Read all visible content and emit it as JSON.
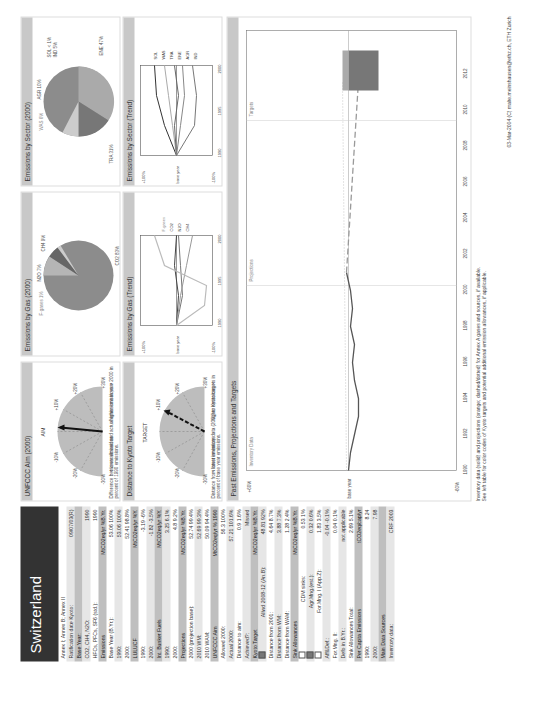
{
  "country": "Switzerland",
  "sidebar": {
    "rows": [
      {
        "type": "text",
        "label": "Annex I; Annex B; Annex II",
        "value": ""
      },
      {
        "type": "text",
        "label": "Ratification date Kyoto:",
        "value": "09/07/03(R)"
      },
      {
        "type": "section",
        "label": "Base Year:",
        "value": ""
      },
      {
        "type": "text",
        "label": "CO2, CH4, N2O:",
        "value": "1990"
      },
      {
        "type": "text",
        "label": "HFCs, PFCs, SF6 (std.):",
        "value": "1990"
      },
      {
        "type": "section",
        "label": "Emissions",
        "value": "MtCO2eq/yr   %B.Yr."
      },
      {
        "type": "text",
        "label": "Base Year (B.Yr.):",
        "value": "53.06   100%"
      },
      {
        "type": "text",
        "label": "1990:",
        "value": "53.06   100%"
      },
      {
        "type": "text",
        "label": "2000:",
        "value": "52.41   98.8%"
      },
      {
        "type": "section",
        "label": "LULUCF",
        "value": "MtCO2eq/yr   %Y."
      },
      {
        "type": "text",
        "label": "1990:",
        "value": "-3.19   -6%"
      },
      {
        "type": "text",
        "label": "2000:",
        "value": "-1.82   -3.5%"
      },
      {
        "type": "section",
        "label": "Int. Bunker Fuels",
        "value": "MtCO2eq/yr   %Y."
      },
      {
        "type": "text",
        "label": "1990:",
        "value": "3.25   6.1%"
      },
      {
        "type": "text",
        "label": "2000:",
        "value": "4.8   9.2%"
      },
      {
        "type": "section",
        "label": "Projections",
        "value": "MtCO2eq/yr   %B.Yr."
      },
      {
        "type": "text",
        "label": "2000 (projection base):",
        "value": "52.74   99.4%"
      },
      {
        "type": "text",
        "label": "2010 WM:",
        "value": "52.69   99.3%"
      },
      {
        "type": "text",
        "label": "2010 WAM:",
        "value": "50.09   94.4%"
      },
      {
        "type": "section",
        "label": "UNFCCC Aim",
        "value": "MtCO2eq/yr   % 1990"
      },
      {
        "type": "text",
        "label": "Allowed 2000:",
        "value": "56.3   100%"
      },
      {
        "type": "text",
        "label": "Actual 2000:",
        "value": "57.21   101.6%"
      },
      {
        "type": "text",
        "label": "Distance to aim:",
        "value": "0.9   1.6%"
      },
      {
        "type": "text",
        "label": "Achieved?:",
        "value": "Missed"
      },
      {
        "type": "section",
        "label": "Kyoto Target",
        "value": "MtCO2eq/yr   %B.Yr."
      },
      {
        "type": "check",
        "label": "Allwd 2008-12 (An.B):",
        "value": "48.81   92%",
        "checked": true
      },
      {
        "type": "text",
        "label": "Distance from 2001:",
        "value": "4.64   8.7%"
      },
      {
        "type": "text",
        "label": "Distance from WM:",
        "value": "3.88   7.3%"
      },
      {
        "type": "text",
        "label": "Distance from WAM:",
        "value": "1.28   2.4%"
      },
      {
        "type": "section",
        "label": "Sink Allowances",
        "value": "MtCO2eq/yr   %B.Yr."
      },
      {
        "type": "check",
        "label": "CDM sinks:",
        "value": "0.53   1%",
        "checked": false
      },
      {
        "type": "check",
        "label": "Agr.Mng.(est.):",
        "value": "0.32   0.6%",
        "checked": true
      },
      {
        "type": "check",
        "label": "For.Mng. I (App.Z):",
        "value": "1.83   3.5%",
        "checked": false
      },
      {
        "type": "text",
        "label": "Aff&Def.:",
        "value": "-0.04   -0.1%"
      },
      {
        "type": "text",
        "label": "For.Mng. II:",
        "value": "0.04   0.1%"
      },
      {
        "type": "text",
        "label": "Defo in B.Yr.:",
        "value": "not applicable"
      },
      {
        "type": "text",
        "label": "Sink Allowances Total:",
        "value": "2.69   5.1%"
      },
      {
        "type": "section",
        "label": "Per Capita Emissions",
        "value": "tCO2eq/cap/yr"
      },
      {
        "type": "text",
        "label": "1990:",
        "value": "8.24"
      },
      {
        "type": "text",
        "label": "2000:",
        "value": "7.98"
      },
      {
        "type": "section",
        "label": "Main Data Sources",
        "value": ""
      },
      {
        "type": "text",
        "label": "Inventory data:",
        "value": "CRF 2003"
      }
    ]
  },
  "panels": {
    "unfccc": {
      "title": "UNFCCC Aim (2000)",
      "dial_label": "AIM",
      "ticks": [
        "-30%",
        "-20%",
        "-10%",
        "+10%",
        "+20%",
        "+30%"
      ],
      "lower": "< lower emissions",
      "higher": "higher emissions >",
      "caption": "Difference between allowed and actual emissions in year 2000 in percent of 1990 emissions."
    },
    "kyoto": {
      "title": "Distance to Kyoto Target",
      "dial_label": "TARGET",
      "ticks": [
        "-30%",
        "-20%",
        "-10%",
        "+10%",
        "+20%",
        "+30%"
      ],
      "lower": "< lower emissions",
      "higher": "higher emissions >",
      "caption": "Distance from latest inventory data (2001) to Kyoto targets in percent of base year emissions."
    },
    "gas_pie": {
      "title": "Emissions by Gas (2000)",
      "labels": [
        "F-gases 1%",
        "N2O 7%",
        "CH4 9%",
        "CO2 83%"
      ]
    },
    "sector_pie": {
      "title": "Emissions by Sector (2000)",
      "labels": [
        "WAS 6%",
        "AGR 10%",
        "SOL < 1%",
        "IND 5%",
        "TRA 31%",
        "ENE 47%"
      ]
    },
    "gas_trend": {
      "title": "Emissions by Gas (Trend)",
      "yticks": [
        "+100%",
        "+50%",
        "+20%",
        "+10%",
        "base year",
        "-10%",
        "-20%",
        "-50%",
        "-100%"
      ],
      "xticks": [
        "1990",
        "1995",
        "2000"
      ],
      "legend": [
        "F-gases",
        "CO2",
        "N2O",
        "CH4"
      ]
    },
    "sector_trend": {
      "title": "Emissions by Sector (Trend)",
      "yticks": [
        "+100%",
        "+50%",
        "+20%",
        "+10%",
        "base year",
        "-10%",
        "-20%",
        "-50%",
        "-100%"
      ],
      "xticks": [
        "1990",
        "1995",
        "2000"
      ],
      "legend": [
        "SOL",
        "WAS",
        "TRA",
        "ENE",
        "AGR",
        "IND"
      ]
    },
    "past": {
      "title": "Past Emissions, Projections and Targets",
      "section_labels": [
        "Inventory Data",
        "Projections",
        "Targets"
      ],
      "yticks": [
        "+60%",
        "+50%",
        "+40%",
        "+30%",
        "+20%",
        "+10%",
        "base year",
        "-10%",
        "-20%",
        "-30%",
        "-40%",
        "-60%"
      ],
      "xticks": [
        "1990",
        "1992",
        "1994",
        "1996",
        "1998",
        "2000",
        "2002",
        "2004",
        "2006",
        "2008",
        "2010",
        "2012"
      ]
    }
  },
  "footer": {
    "line1": "Inventory data (solid) and projections (orange; dashed/dotted) for Annex A gases and sources, if available.",
    "line2": "See left table for color codes of Kyoto targets and potential additional emission allowances, if applicable.",
    "credit": "03-Mar-2004 (C) malte.meinshausen@ethz.ch, ETH Zurich"
  },
  "chart_data": [
    {
      "type": "pie",
      "title": "Emissions by Gas (2000)",
      "categories": [
        "CO2",
        "CH4",
        "N2O",
        "F-gases"
      ],
      "values": [
        83,
        9,
        7,
        1
      ]
    },
    {
      "type": "pie",
      "title": "Emissions by Sector (2000)",
      "categories": [
        "ENE",
        "TRA",
        "AGR",
        "WAS",
        "IND",
        "SOL"
      ],
      "values": [
        47,
        31,
        10,
        6,
        5,
        1
      ]
    },
    {
      "type": "line",
      "title": "Past Emissions, Projections and Targets",
      "x": [
        1990,
        1991,
        1992,
        1993,
        1994,
        1995,
        1996,
        1997,
        1998,
        1999,
        2000,
        2001
      ],
      "values": [
        0,
        -1,
        -3,
        -5,
        -5,
        -3,
        -2,
        -3,
        -1,
        -2,
        -1,
        1
      ],
      "ylabel": "% of base year",
      "ylim": [
        -60,
        60
      ]
    }
  ]
}
